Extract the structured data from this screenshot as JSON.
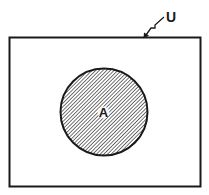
{
  "diagram": {
    "type": "venn",
    "universe": {
      "label": "U"
    },
    "sets": [
      {
        "label": "A",
        "shaded": true
      }
    ],
    "colors": {
      "stroke": "#1a1a1a",
      "hatch": "#2a2a2a",
      "background": "#ffffff"
    }
  }
}
